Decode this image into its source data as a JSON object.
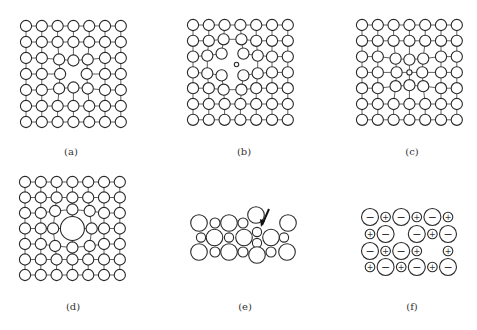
{
  "figure": {
    "stroke_color": "#2a2a2a",
    "background": "#ffffff"
  },
  "panels": [
    {
      "id": "a",
      "label": "(a)",
      "defect": "vacancy",
      "label_x": 71,
      "label_y": 153,
      "grid": {
        "x0": 26,
        "y0": 26,
        "dx": 15.8,
        "dy": 16.0,
        "rows": 7,
        "cols": 7,
        "r": 5.6
      },
      "missing": [
        [
          3,
          3
        ]
      ],
      "shifts": {
        "2,2": [
          1.5,
          1.5
        ],
        "2,3": [
          0,
          2.5
        ],
        "2,4": [
          -1.5,
          1.5
        ],
        "3,2": [
          2.5,
          0
        ],
        "3,4": [
          -2.5,
          0
        ],
        "4,2": [
          1.5,
          -1.5
        ],
        "4,3": [
          0,
          -2.5
        ],
        "4,4": [
          -1.5,
          -1.5
        ]
      },
      "extra": []
    },
    {
      "id": "b",
      "label": "(b)",
      "defect": "interstitial",
      "label_x": 244,
      "label_y": 153,
      "grid": {
        "x0": 193,
        "y0": 25,
        "dx": 15.8,
        "dy": 15.8,
        "rows": 7,
        "cols": 7,
        "r": 5.6
      },
      "missing": [],
      "shifts": {
        "2,2": [
          -3,
          -3
        ],
        "2,3": [
          3,
          -3
        ],
        "3,2": [
          -3,
          3
        ],
        "3,3": [
          3,
          3
        ],
        "1,2": [
          -1,
          -1.5
        ],
        "1,3": [
          1,
          -1.5
        ],
        "2,1": [
          -1.5,
          -1
        ],
        "3,1": [
          -1.5,
          1
        ],
        "2,4": [
          1.5,
          -1
        ],
        "3,4": [
          1.5,
          1
        ],
        "4,2": [
          -1,
          1.5
        ],
        "4,3": [
          1,
          1.5
        ]
      },
      "extra": [
        {
          "cx": 236.5,
          "cy": 64.5,
          "r": 2.2,
          "kind": "interstitial-small-atom"
        }
      ],
      "skip_bonds_between": [
        [
          "2,2",
          "3,2"
        ],
        [
          "2,3",
          "3,3"
        ],
        [
          "2,2",
          "2,3"
        ],
        [
          "3,2",
          "3,3"
        ]
      ]
    },
    {
      "id": "c",
      "label": "(c)",
      "defect": "small-substitutional",
      "label_x": 412,
      "label_y": 153,
      "grid": {
        "x0": 362,
        "y0": 25,
        "dx": 15.8,
        "dy": 15.8,
        "rows": 7,
        "cols": 7,
        "r": 5.6
      },
      "missing": [],
      "shifts": {
        "2,2": [
          2,
          2
        ],
        "2,3": [
          0,
          3
        ],
        "2,4": [
          -2,
          2
        ],
        "3,2": [
          3,
          0
        ],
        "3,4": [
          -3,
          0
        ],
        "4,2": [
          2,
          -2
        ],
        "4,3": [
          0,
          -3
        ],
        "4,4": [
          -2,
          -2
        ]
      },
      "substitute": {
        "row": 3,
        "col": 3,
        "r": 2.6
      },
      "extra": []
    },
    {
      "id": "d",
      "label": "(d)",
      "defect": "large-substitutional",
      "label_x": 73,
      "label_y": 308,
      "grid": {
        "x0": 25,
        "y0": 182,
        "dx": 15.8,
        "dy": 15.5,
        "rows": 7,
        "cols": 7,
        "r": 5.6
      },
      "missing": [],
      "shifts": {
        "2,2": [
          -1.5,
          -2
        ],
        "2,3": [
          0,
          -3.5
        ],
        "2,4": [
          1.5,
          -2
        ],
        "3,2": [
          -3.5,
          0
        ],
        "3,4": [
          3.5,
          0
        ],
        "4,2": [
          -1.5,
          2
        ],
        "4,3": [
          0,
          3.5
        ],
        "4,4": [
          1.5,
          2
        ]
      },
      "substitute": {
        "row": 3,
        "col": 3,
        "r": 12
      },
      "extra": []
    },
    {
      "id": "e",
      "label": "(e)",
      "defect": "frenkel",
      "label_x": 245,
      "label_y": 308,
      "ions": [
        {
          "cx": 199,
          "cy": 223,
          "r": 8.3
        },
        {
          "cx": 215,
          "cy": 223,
          "r": 5
        },
        {
          "cx": 229,
          "cy": 223,
          "r": 8.3
        },
        {
          "cx": 243,
          "cy": 223,
          "r": 5
        },
        {
          "cx": 256,
          "cy": 215,
          "r": 8.3
        },
        {
          "cx": 288,
          "cy": 223,
          "r": 8.3
        },
        {
          "cx": 201,
          "cy": 237.5,
          "r": 4.6
        },
        {
          "cx": 214.5,
          "cy": 237.5,
          "r": 8.3
        },
        {
          "cx": 229,
          "cy": 237.5,
          "r": 4.6
        },
        {
          "cx": 244,
          "cy": 237.5,
          "r": 8.3
        },
        {
          "cx": 257,
          "cy": 232,
          "r": 4.6
        },
        {
          "cx": 257,
          "cy": 243,
          "r": 4.6
        },
        {
          "cx": 271,
          "cy": 237.5,
          "r": 8.3
        },
        {
          "cx": 284,
          "cy": 237.5,
          "r": 4.6
        },
        {
          "cx": 199,
          "cy": 252,
          "r": 8.3
        },
        {
          "cx": 215,
          "cy": 252,
          "r": 5
        },
        {
          "cx": 229,
          "cy": 252,
          "r": 8.3
        },
        {
          "cx": 243,
          "cy": 252,
          "r": 5
        },
        {
          "cx": 257,
          "cy": 255,
          "r": 8.3
        },
        {
          "cx": 271,
          "cy": 252,
          "r": 5
        },
        {
          "cx": 287,
          "cy": 252,
          "r": 8.3
        }
      ],
      "arrow": {
        "x1": 269,
        "y1": 209,
        "x2": 262,
        "y2": 225
      }
    },
    {
      "id": "f",
      "label": "(f)",
      "defect": "schottky",
      "label_x": 412,
      "label_y": 308,
      "rows": [
        {
          "y": 217,
          "cells": [
            "-",
            "+",
            "-",
            "+",
            "-",
            "+"
          ]
        },
        {
          "y": 234,
          "cells": [
            "+",
            "-",
            "",
            "-",
            "+",
            "-"
          ]
        },
        {
          "y": 251,
          "cells": [
            "-",
            "+",
            "-",
            "+",
            "",
            "+"
          ]
        },
        {
          "y": 267,
          "cells": [
            "+",
            "-",
            "+",
            "-",
            "+",
            "-"
          ]
        }
      ],
      "x0": 370,
      "dx": 15.6,
      "anion_r": 8.5,
      "cation_r": 4.8,
      "charge_symbols": {
        "+": "+",
        "-": "−"
      }
    }
  ]
}
